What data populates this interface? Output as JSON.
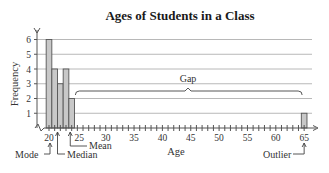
{
  "chart_data": {
    "type": "bar",
    "title": "Ages of Students in a Class",
    "xlabel": "Age",
    "ylabel": "Frequency",
    "x": [
      20,
      21,
      22,
      23,
      24,
      65
    ],
    "values": [
      6,
      4,
      3,
      4,
      2,
      1
    ],
    "xlim": [
      19,
      66
    ],
    "ylim": [
      0,
      6
    ],
    "x_tick_labels": [
      "20",
      "25",
      "30",
      "35",
      "40",
      "45",
      "50",
      "55",
      "60",
      "65"
    ],
    "x_tick_values": [
      20,
      25,
      30,
      35,
      40,
      45,
      50,
      55,
      60,
      65
    ],
    "x_minor_tick_step": 1,
    "y_tick_labels": [
      "1",
      "2",
      "3",
      "4",
      "5",
      "6"
    ],
    "y_tick_values": [
      1,
      2,
      3,
      4,
      5,
      6
    ],
    "grid": "horizontal",
    "legend": null,
    "annotations": [
      {
        "label": "Mode",
        "x": 20
      },
      {
        "label": "Median",
        "x": 21.5
      },
      {
        "label": "Mean",
        "x": 23.75
      },
      {
        "label": "Gap",
        "x_from": 25,
        "x_to": 65
      },
      {
        "label": "Outlier",
        "x": 65
      }
    ]
  },
  "labels": {
    "title": "Ages of Students in a Class",
    "xlabel": "Age",
    "ylabel": "Frequency",
    "mode": "Mode",
    "median": "Median",
    "mean": "Mean",
    "gap": "Gap",
    "outlier": "Outlier"
  }
}
